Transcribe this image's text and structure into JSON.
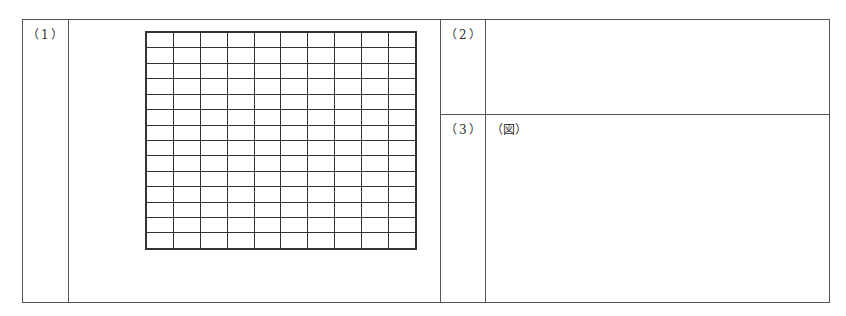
{
  "sheet": {
    "sections": [
      {
        "id": "1",
        "label": "（1）",
        "content": "grid",
        "grid": {
          "rows": 14,
          "cols": 10
        }
      },
      {
        "id": "2",
        "label": "（2）",
        "content": ""
      },
      {
        "id": "3",
        "label": "（3）",
        "content": "（図）"
      }
    ]
  }
}
